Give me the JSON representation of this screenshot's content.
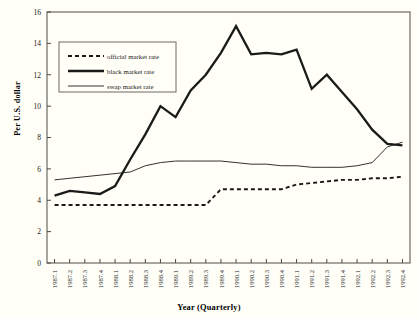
{
  "chart_data": {
    "type": "line",
    "title": "",
    "xlabel": "Year (Quarterly)",
    "ylabel": "Per U.S. dollar",
    "ylim": [
      0,
      16
    ],
    "yticks": [
      0,
      2,
      4,
      6,
      8,
      10,
      12,
      14,
      16
    ],
    "ytick_labels": [
      "0",
      "2",
      "4",
      "6",
      "8",
      "10",
      "12",
      "14",
      "16"
    ],
    "grid": false,
    "legend_position": "upper-left-inside",
    "categories": [
      "1987.1",
      "1987.2",
      "1987.3",
      "1987.4",
      "1988.1",
      "1988.2",
      "1988.3",
      "1988.4",
      "1989.1",
      "1989.2",
      "1989.3",
      "1989.4",
      "1990.1",
      "1990.2",
      "1990.3",
      "1990.4",
      "1991.1",
      "1991.2",
      "1991.3",
      "1991.4",
      "1992.1",
      "1992.2",
      "1992.3",
      "1992.4"
    ],
    "series": [
      {
        "name": "official market rate",
        "style": "dashed",
        "values": [
          3.7,
          3.7,
          3.7,
          3.7,
          3.7,
          3.7,
          3.7,
          3.7,
          3.7,
          3.7,
          3.7,
          4.7,
          4.7,
          4.7,
          4.7,
          4.7,
          5.0,
          5.1,
          5.2,
          5.3,
          5.3,
          5.4,
          5.4,
          5.5
        ]
      },
      {
        "name": "black market rate",
        "style": "thick-solid",
        "values": [
          4.3,
          4.6,
          4.5,
          4.4,
          4.9,
          6.6,
          8.2,
          10.0,
          9.3,
          11.0,
          12.0,
          13.4,
          15.1,
          13.3,
          13.4,
          13.3,
          13.6,
          11.1,
          12.0,
          10.9,
          9.8,
          8.5,
          7.6,
          7.5
        ]
      },
      {
        "name": "swap market rate",
        "style": "thin-solid",
        "values": [
          5.3,
          5.4,
          5.5,
          5.6,
          5.7,
          5.8,
          6.2,
          6.4,
          6.5,
          6.5,
          6.5,
          6.5,
          6.4,
          6.3,
          6.3,
          6.2,
          6.2,
          6.1,
          6.1,
          6.1,
          6.2,
          6.4,
          7.4,
          7.7
        ]
      }
    ],
    "legend": [
      {
        "label": "official market rate",
        "style": "dashed"
      },
      {
        "label": "black market rate",
        "style": "thick-solid"
      },
      {
        "label": "swap market rate",
        "style": "thin-solid"
      }
    ]
  }
}
